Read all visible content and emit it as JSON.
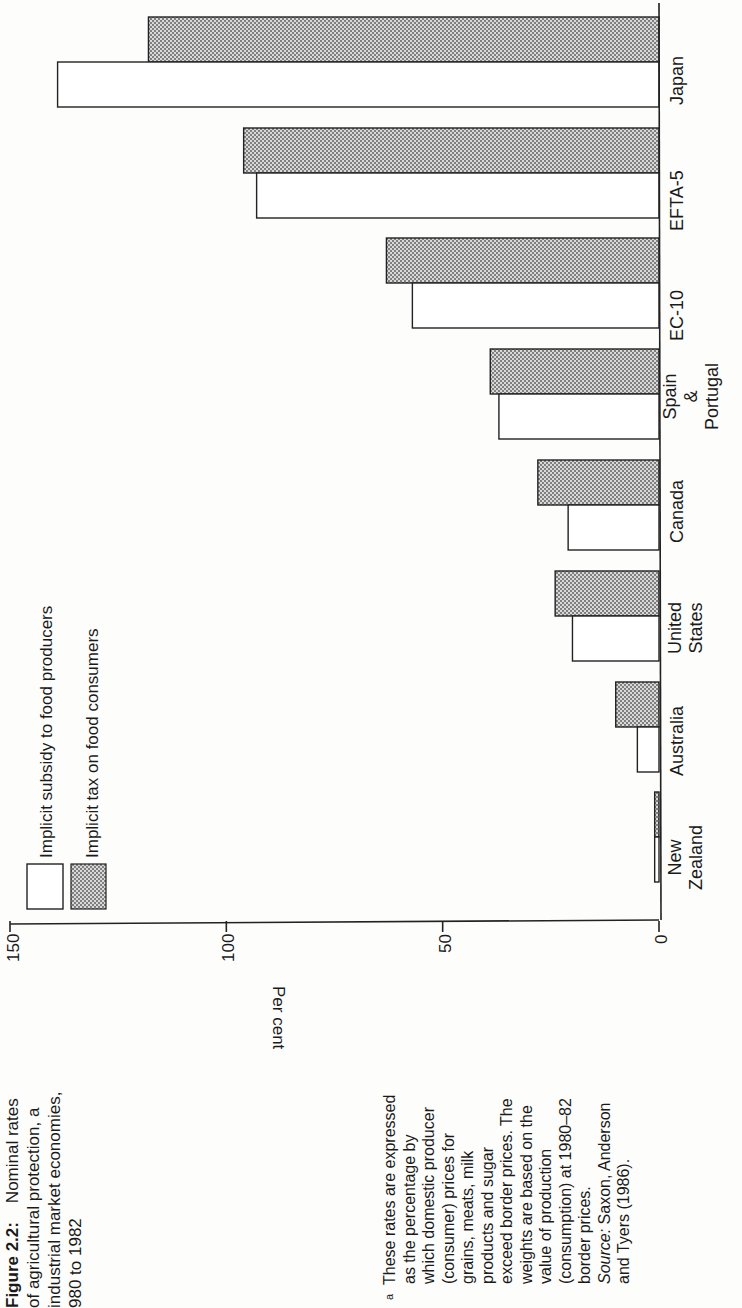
{
  "figure": {
    "label": "Figure 2.2:",
    "title_lines": [
      "Nominal rates",
      "of agricultural protection, a",
      "industrial market economies,",
      "980 to 1982"
    ]
  },
  "footnote": {
    "marker": "a",
    "lines": [
      "These rates are expressed",
      "as the percentage by",
      "which domestic producer",
      "(consumer) prices for",
      "grains, meats, milk",
      "products and sugar",
      "exceed border prices. The",
      "weights are based on the",
      "value of production",
      "(consumption) at 1980–82",
      "border prices."
    ],
    "source_label": "Source:",
    "source_text": "Saxon, Anderson",
    "source_text2": "and Tyers (1986)."
  },
  "legend": {
    "items": [
      {
        "label": "Implicit subsidy to food producers",
        "fill": "#ffffff"
      },
      {
        "label": "Implicit tax on food consumers",
        "fill": "dotted-grey"
      }
    ]
  },
  "axis": {
    "label": "Per cent",
    "ticks": [
      "150",
      "100",
      "50",
      "0"
    ]
  },
  "chart_data": {
    "type": "bar",
    "orientation": "horizontal (page rotated 90°)",
    "categories": [
      "New Zealand",
      "Australia",
      "United States",
      "Canada",
      "Spain & Portugal",
      "EC-10",
      "EFTA-5",
      "Japan"
    ],
    "series": [
      {
        "name": "Implicit subsidy to food producers",
        "values": [
          1,
          5,
          20,
          21,
          37,
          57,
          93,
          139
        ]
      },
      {
        "name": "Implicit tax on food consumers",
        "values": [
          1,
          10,
          24,
          28,
          39,
          63,
          96,
          118
        ]
      }
    ],
    "xlabel": "",
    "ylabel": "Per cent",
    "ylim": [
      0,
      150
    ],
    "yticks": [
      0,
      50,
      100,
      150
    ],
    "grid": false,
    "legend_position": "upper-left (rotated)"
  }
}
